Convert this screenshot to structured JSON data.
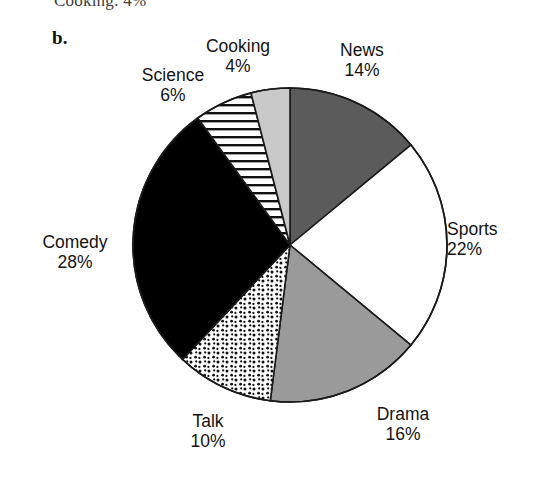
{
  "figure": {
    "part_label": "b.",
    "clipped_caption_above": "Cooking: 4%"
  },
  "labels": {
    "cooking": {
      "name": "Cooking",
      "value": "4%"
    },
    "news": {
      "name": "News",
      "value": "14%"
    },
    "sports": {
      "name": "Sports",
      "value": "22%"
    },
    "drama": {
      "name": "Drama",
      "value": "16%"
    },
    "talk": {
      "name": "Talk",
      "value": "10%"
    },
    "comedy": {
      "name": "Comedy",
      "value": "28%"
    },
    "science": {
      "name": "Science",
      "value": "6%"
    }
  },
  "chart_data": {
    "type": "pie",
    "title": "",
    "xlabel": "",
    "ylabel": "",
    "units": "percent",
    "start_angle_deg": 0,
    "direction": "clockwise",
    "total": 100,
    "categories": [
      "News",
      "Sports",
      "Drama",
      "Talk",
      "Comedy",
      "Science",
      "Cooking"
    ],
    "values": [
      14,
      22,
      16,
      10,
      28,
      6,
      4
    ],
    "slices": [
      {
        "label": "News",
        "value": 14,
        "fill": "#5b5b5b",
        "pattern": "solid-dark-gray",
        "start_deg": 0,
        "end_deg": 50.4
      },
      {
        "label": "Sports",
        "value": 22,
        "fill": "#ffffff",
        "pattern": "solid-white",
        "start_deg": 50.4,
        "end_deg": 129.6
      },
      {
        "label": "Drama",
        "value": 16,
        "fill": "#9a9a9a",
        "pattern": "solid-medium-gray",
        "start_deg": 129.6,
        "end_deg": 187.2
      },
      {
        "label": "Talk",
        "value": 10,
        "fill": "#ffffff",
        "pattern": "stipple-dots",
        "start_deg": 187.2,
        "end_deg": 223.2
      },
      {
        "label": "Comedy",
        "value": 28,
        "fill": "#000000",
        "pattern": "solid-black",
        "start_deg": 223.2,
        "end_deg": 324.0
      },
      {
        "label": "Science",
        "value": 6,
        "fill": "#ffffff",
        "pattern": "horizontal-lines",
        "start_deg": 324.0,
        "end_deg": 345.6
      },
      {
        "label": "Cooking",
        "value": 4,
        "fill": "#c9c9c9",
        "pattern": "solid-light-gray",
        "start_deg": 345.6,
        "end_deg": 360.0
      }
    ],
    "legend": "none (labels placed around pie)",
    "grid": false,
    "colors": {
      "outline": "#1a1a1a",
      "news": "#5b5b5b",
      "sports": "#ffffff",
      "drama": "#9a9a9a",
      "talk": "#ffffff",
      "comedy": "#000000",
      "science": "#ffffff",
      "cooking": "#c9c9c9"
    },
    "geometry": {
      "cx": 290,
      "cy": 245,
      "r": 157
    }
  }
}
